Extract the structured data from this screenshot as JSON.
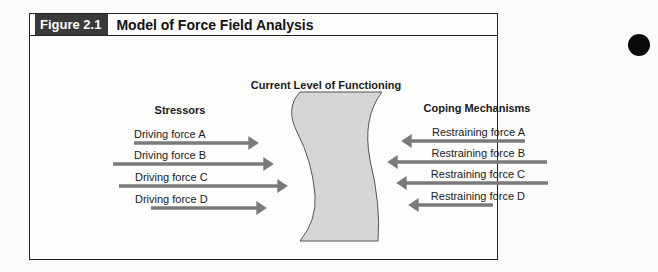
{
  "figure": {
    "label": "Figure 2.1",
    "title": "Model of Force Field Analysis",
    "center_heading": "Current Level of Functioning",
    "left_heading": "Stressors",
    "right_heading": "Coping Mechanisms",
    "driving_forces": [
      {
        "label": "Driving force A"
      },
      {
        "label": "Driving force B"
      },
      {
        "label": "Driving force C"
      },
      {
        "label": "Driving force D"
      }
    ],
    "restraining_forces": [
      {
        "label": "Restraining force A"
      },
      {
        "label": "Restraining force B"
      },
      {
        "label": "Restraining force C"
      },
      {
        "label": "Restraining force D"
      }
    ]
  },
  "colors": {
    "arrow": "#7a7a7a",
    "shape_fill": "#d6d6d6",
    "label_bg": "#3a3a3a"
  }
}
